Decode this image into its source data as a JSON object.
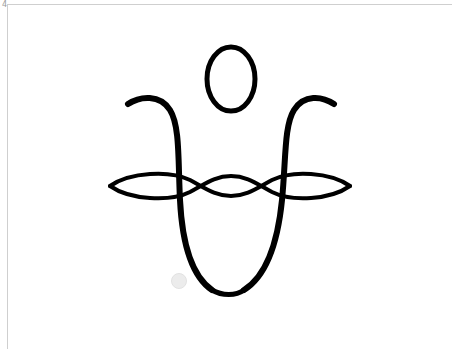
{
  "page": {
    "number": "4"
  },
  "logo": {
    "description": "Calligraphic meditating figure: head ellipse, U-shaped body with curled arms, braided horizontal loops",
    "stroke_color": "#000000",
    "background_color": "#ffffff"
  },
  "frame": {
    "color": "#cfcfcf"
  },
  "watermark": {
    "color": "#ececec"
  }
}
